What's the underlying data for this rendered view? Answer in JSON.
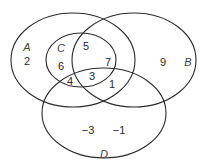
{
  "diagram": {
    "type": "venn",
    "stroke_color": "#2a2a2a",
    "sets": [
      {
        "name": "A",
        "label": "A",
        "cx": 73,
        "cy": 60,
        "rx": 62,
        "ry": 47,
        "label_x": 27,
        "label_y": 47
      },
      {
        "name": "B",
        "label": "B",
        "cx": 134,
        "cy": 60,
        "rx": 62,
        "ry": 47,
        "label_x": 188,
        "label_y": 62
      },
      {
        "name": "C",
        "label": "C",
        "cx": 81,
        "cy": 60,
        "rx": 35,
        "ry": 27,
        "label_x": 61,
        "label_y": 48
      },
      {
        "name": "D",
        "label": "D",
        "cx": 104,
        "cy": 113,
        "rx": 62,
        "ry": 45,
        "label_x": 104,
        "label_y": 154
      }
    ],
    "elements": [
      {
        "value": "2",
        "x": 27,
        "y": 61,
        "region": "A only"
      },
      {
        "value": "6",
        "x": 61,
        "y": 66,
        "region": "A and C"
      },
      {
        "value": "5",
        "x": 86,
        "y": 46,
        "region": "A, B and C"
      },
      {
        "value": "7",
        "x": 108,
        "y": 62,
        "region": "A, B and C"
      },
      {
        "value": "3",
        "x": 92,
        "y": 76,
        "region": "A, B, C and D"
      },
      {
        "value": "4",
        "x": 70,
        "y": 81,
        "region": "A, C and D"
      },
      {
        "value": "1",
        "x": 112,
        "y": 84,
        "region": "A, B and D"
      },
      {
        "value": "9",
        "x": 163,
        "y": 62,
        "region": "B only"
      },
      {
        "value": "−3",
        "x": 88,
        "y": 130,
        "region": "D only"
      },
      {
        "value": "−1",
        "x": 119,
        "y": 130,
        "region": "D only"
      }
    ]
  }
}
